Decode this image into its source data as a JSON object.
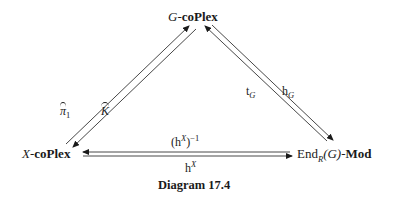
{
  "diagram": {
    "nodes": {
      "top": {
        "prefix": "G",
        "suffix": "coPlex"
      },
      "left": {
        "prefix": "X",
        "suffix": "coPlex"
      },
      "right": {
        "main": "End",
        "sub": "R",
        "arg": "(G)",
        "suffix": "Mod"
      }
    },
    "arrows": {
      "left_up": {
        "label": "π",
        "sub": "1",
        "hat": true,
        "from": "X-coPlex",
        "to": "G-coPlex"
      },
      "left_down": {
        "label": "K",
        "hat": true,
        "from": "G-coPlex",
        "to": "X-coPlex"
      },
      "right_up": {
        "label": "t",
        "sub": "G",
        "from": "End_R(G)-Mod",
        "to": "G-coPlex"
      },
      "right_down": {
        "label": "h",
        "sub": "G",
        "from": "G-coPlex",
        "to": "End_R(G)-Mod"
      },
      "bottom_left": {
        "label": "(h",
        "sup": "X",
        "suffix": ")",
        "sup2": "−1",
        "from": "End_R(G)-Mod",
        "to": "X-coPlex"
      },
      "bottom_right": {
        "label": "h",
        "sup": "X",
        "from": "X-coPlex",
        "to": "End_R(G)-Mod"
      }
    },
    "caption": "Diagram 17.4",
    "dash": "-"
  }
}
